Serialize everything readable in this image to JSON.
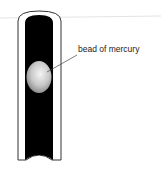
{
  "diagram": {
    "title": "",
    "labels": {
      "bead": "bead of mercury"
    },
    "elements": [
      {
        "name": "glass-tube",
        "description": "vertical glass tube with domed top and concave bottom"
      },
      {
        "name": "mercury-bead",
        "description": "grey shaded oval bead inside the tube"
      },
      {
        "name": "leader-line",
        "description": "line from label to bead"
      }
    ],
    "colors": {
      "tube_interior": "#000000",
      "tube_wall": "#ffffff",
      "outline": "#333333",
      "bead": "#c8c8c8",
      "background": "#ffffff"
    }
  }
}
